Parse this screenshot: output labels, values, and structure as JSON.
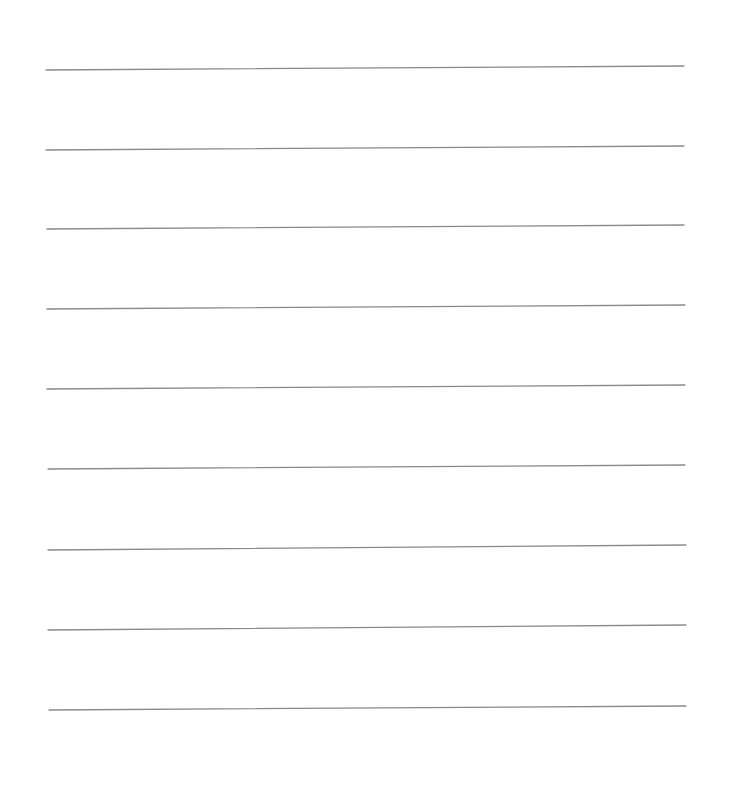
{
  "page": {
    "type": "lined-paper",
    "background_color": "#ffffff",
    "line_color": "#8a8a8a",
    "lines": [
      {
        "x1": 46,
        "y1": 70,
        "x2": 684,
        "y2": 66
      },
      {
        "x1": 46,
        "y1": 150,
        "x2": 684,
        "y2": 146
      },
      {
        "x1": 47,
        "y1": 229,
        "x2": 684,
        "y2": 225
      },
      {
        "x1": 47,
        "y1": 309,
        "x2": 685,
        "y2": 305
      },
      {
        "x1": 47,
        "y1": 389,
        "x2": 685,
        "y2": 385
      },
      {
        "x1": 48,
        "y1": 469,
        "x2": 685,
        "y2": 465
      },
      {
        "x1": 48,
        "y1": 550,
        "x2": 686,
        "y2": 545
      },
      {
        "x1": 48,
        "y1": 630,
        "x2": 686,
        "y2": 625
      },
      {
        "x1": 49,
        "y1": 710,
        "x2": 686,
        "y2": 706
      }
    ]
  }
}
